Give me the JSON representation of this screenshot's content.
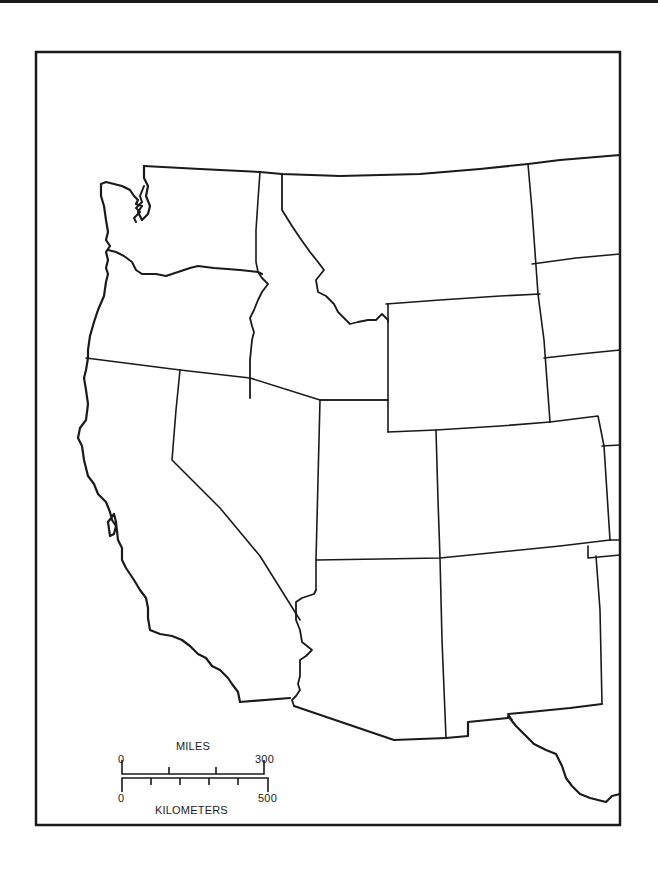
{
  "map": {
    "title": "",
    "region": "Western United States",
    "style": {
      "background": "#ffffff",
      "line_color": "#1a1a1a",
      "frame_color": "#1a1a1a"
    },
    "states": [
      "Washington",
      "Oregon",
      "California",
      "Idaho",
      "Nevada",
      "Montana",
      "Wyoming",
      "Utah",
      "Arizona",
      "Colorado",
      "New Mexico"
    ]
  },
  "scale_bar": {
    "miles": {
      "unit_label": "MILES",
      "start_label": "0",
      "end_label": "300"
    },
    "kilometers": {
      "unit_label": "KILOMETERS",
      "start_label": "0",
      "end_label": "500"
    }
  }
}
